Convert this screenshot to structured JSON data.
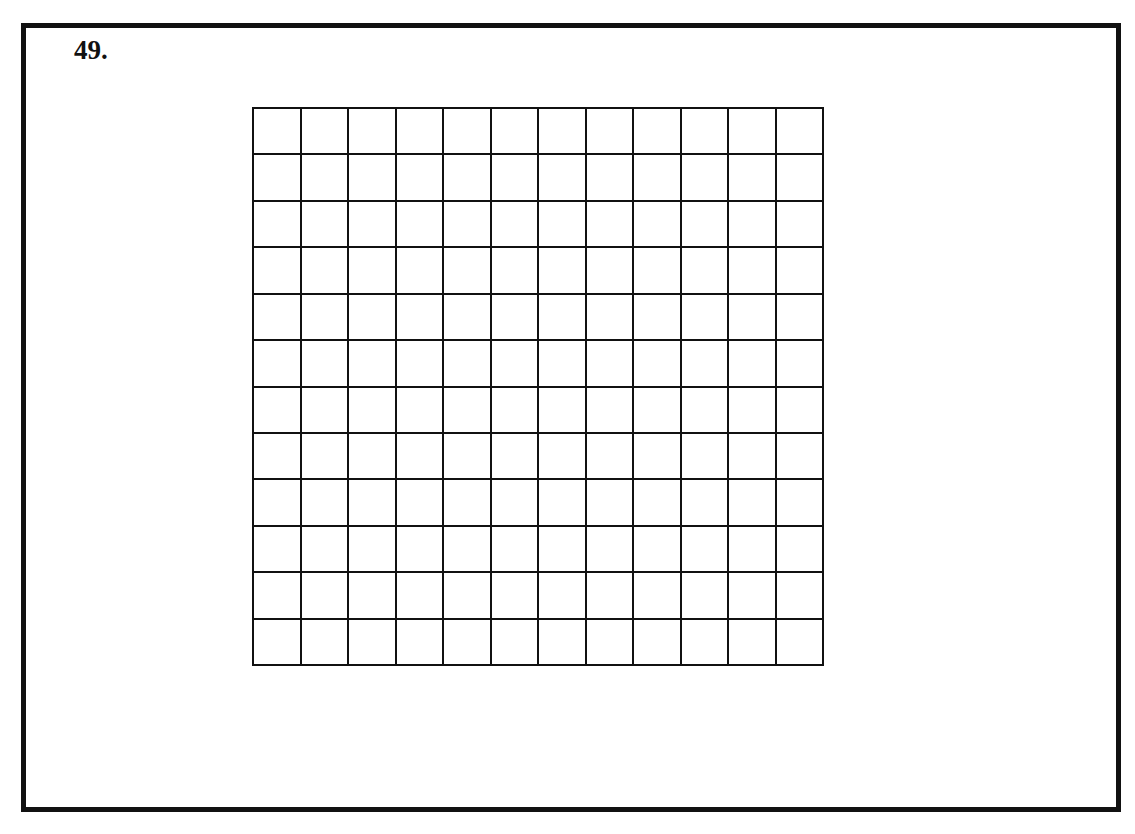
{
  "page": {
    "problem_number": "49.",
    "colors": {
      "ink": "#111111",
      "paper": "#ffffff"
    }
  },
  "grid": {
    "rows": 12,
    "columns": 12,
    "shaded_cells": []
  }
}
